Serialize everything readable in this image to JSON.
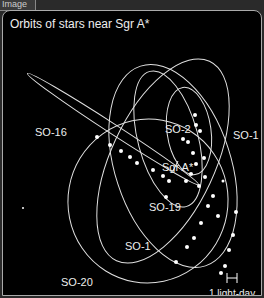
{
  "tab": {
    "label": "Image"
  },
  "figure": {
    "title": "Orbits of stars near Sgr A*",
    "center_label": "Sgr A*",
    "scale_label": "1 light-day",
    "stars": [
      "SO-16",
      "SO-2",
      "SO-1",
      "SO-19",
      "SO-1",
      "SO-20"
    ],
    "colors": {
      "background": "#000000",
      "orbit": "#e0e0e0",
      "text": "#eeeeee"
    }
  },
  "labels": {
    "so16": "SO-16",
    "so2": "SO-2",
    "so1_right": "SO-1",
    "sgra": "Sgr A*",
    "so19": "SO-19",
    "so1_left": "SO-1",
    "so20": "SO-20",
    "scale": "1 light-day",
    "scale_glyph": "H"
  }
}
